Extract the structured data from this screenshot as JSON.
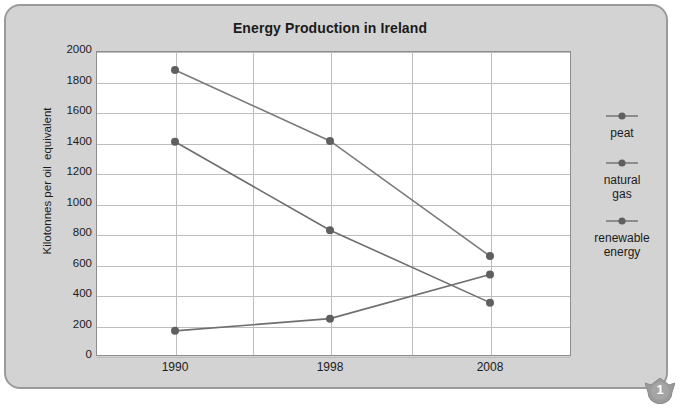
{
  "page": {
    "badge_number": "1"
  },
  "chart_data": {
    "type": "line",
    "title": "Energy Production in Ireland",
    "xlabel": "",
    "ylabel": "Kilotonnes per oil  equivalent",
    "categories": [
      "1990",
      "1998",
      "2008"
    ],
    "x_tick_labels": [
      "1990",
      "1998",
      "2008"
    ],
    "y_tick_labels": [
      "2000",
      "1800",
      "1600",
      "1400",
      "1200",
      "1000",
      "800",
      "600",
      "400",
      "200",
      "0"
    ],
    "ylim": [
      0,
      2000
    ],
    "y_tick_step": 200,
    "grid": true,
    "legend_position": "right",
    "series": [
      {
        "name": "peat",
        "values": [
          1875,
          1410,
          655
        ],
        "color": "#7a7a7a"
      },
      {
        "name": "natural gas",
        "values": [
          1405,
          825,
          350
        ],
        "color": "#6e6e6e"
      },
      {
        "name": "renewable energy",
        "values": [
          165,
          245,
          535
        ],
        "color": "#6e6e6e"
      }
    ],
    "marker_color": "#5f5f5f",
    "line_color": "#7b7b7b"
  },
  "legend": {
    "entries": [
      {
        "label": "peat"
      },
      {
        "label_line1": "natural",
        "label_line2": "gas"
      },
      {
        "label_line1": "renewable",
        "label_line2": "energy"
      }
    ]
  }
}
